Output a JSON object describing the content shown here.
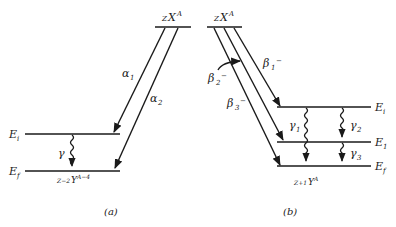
{
  "diagram_a": {
    "parent_label": {
      "prefix": "Z",
      "symbol": "X",
      "sup": "A"
    },
    "transitions": [
      {
        "label": "α",
        "sub": "1"
      },
      {
        "label": "α",
        "sub": "2"
      }
    ],
    "levels": [
      {
        "label": "E",
        "sub": "i"
      },
      {
        "label": "E",
        "sub": "f"
      }
    ],
    "gamma": {
      "label": "γ"
    },
    "daughter_label": {
      "prefix": "Z−2",
      "symbol": "Y",
      "sup": "A−4"
    },
    "caption": "(a)"
  },
  "diagram_b": {
    "parent_label": {
      "prefix": "Z",
      "symbol": "X",
      "sup": "A"
    },
    "transitions": [
      {
        "label": "β",
        "sub": "1",
        "sup": "−"
      },
      {
        "label": "β",
        "sub": "2",
        "sup": "−"
      },
      {
        "label": "β",
        "sub": "3",
        "sup": "−"
      }
    ],
    "levels": [
      {
        "label": "E",
        "sub": "i"
      },
      {
        "label": "E",
        "sub": "1"
      },
      {
        "label": "E",
        "sub": "f"
      }
    ],
    "gammas": [
      {
        "label": "γ",
        "sub": "1"
      },
      {
        "label": "γ",
        "sub": "2"
      },
      {
        "label": "γ",
        "sub": "3"
      }
    ],
    "daughter_label": {
      "prefix": "Z+1",
      "symbol": "Y",
      "sup": "A"
    },
    "caption": "(b)"
  }
}
